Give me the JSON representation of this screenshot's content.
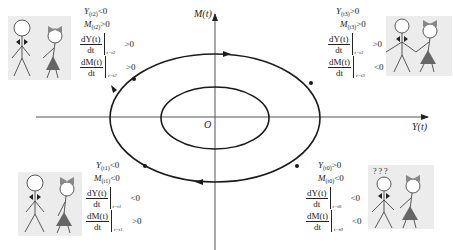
{
  "diagram": {
    "title": "",
    "axes": {
      "y_axis_label": "M(t)",
      "x_axis_label": "Y(t)",
      "origin_label": "O"
    },
    "cycles": [
      {
        "name": "outer-ellipse",
        "direction": "clockwise"
      },
      {
        "name": "inner-ellipse"
      }
    ],
    "quadrants": {
      "top_left": {
        "t": "t2",
        "line1": {
          "var": "Y",
          "sub": "(t2)",
          "op": "<0"
        },
        "line2": {
          "var": "M",
          "sub": "(t2)",
          "op": ">0"
        },
        "dY": {
          "num": "dY(t)",
          "den": "dt",
          "at": "t=t2",
          "op": ">0"
        },
        "dM": {
          "num": "dM(t)",
          "den": "dt",
          "at": "t=t2",
          "op": ">0"
        },
        "figure": "couple-apart"
      },
      "top_right": {
        "t": "t3",
        "line1": {
          "var": "Y",
          "sub": "(t3)",
          "op": ">0"
        },
        "line2": {
          "var": "M",
          "sub": "(t3)",
          "op": ">0"
        },
        "dY": {
          "num": "dY(t)",
          "den": "dt",
          "at": "t=t3",
          "op": ">0"
        },
        "dM": {
          "num": "dM(t)",
          "den": "dt",
          "at": "t=t3",
          "op": "<0"
        },
        "figure": "couple-holding-hands"
      },
      "bottom_left": {
        "t": "t1",
        "line1": {
          "var": "Y",
          "sub": "(t1)",
          "op": "<0"
        },
        "line2": {
          "var": "M",
          "sub": "(t1)",
          "op": "<0"
        },
        "dY": {
          "num": "dY(t)",
          "den": "dt",
          "at": "t=t1",
          "op": "<0"
        },
        "dM": {
          "num": "dM(t)",
          "den": "dt",
          "at": "t=t1",
          "op": ">0"
        },
        "figure": "couple-apart"
      },
      "bottom_right": {
        "t": "t0",
        "line1": {
          "var": "Y",
          "sub": "(t0)",
          "op": ">0"
        },
        "line2": {
          "var": "M",
          "sub": "(t0)",
          "op": "<0"
        },
        "dY": {
          "num": "dY(t)",
          "den": "dt",
          "at": "t=t0",
          "op": "<0"
        },
        "dM": {
          "num": "dM(t)",
          "den": "dt",
          "at": "t=t0",
          "op": "<0"
        },
        "figure": "couple-confused",
        "question_marks": "? ? ?"
      }
    },
    "colors": {
      "line": "#1a1a1a",
      "axis": "#555555",
      "figure_bg": "#ececec",
      "dress": "#666666"
    }
  }
}
